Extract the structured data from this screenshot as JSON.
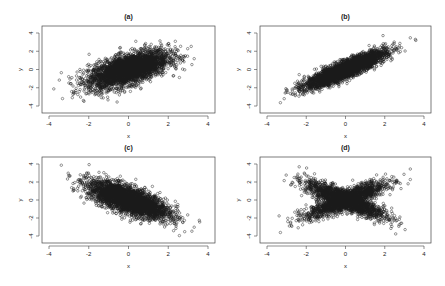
{
  "chart_data": [
    {
      "type": "scatter",
      "title": "(a)",
      "xlabel": "x",
      "ylabel": "y",
      "xlim": [
        -4,
        4
      ],
      "ylim": [
        -4,
        4
      ],
      "xticks": [
        -4,
        -2,
        0,
        2,
        4
      ],
      "yticks": [
        -4,
        -2,
        0,
        2,
        4
      ],
      "grid": false,
      "n_points": 5000,
      "marker": "open-circle",
      "description": "bivariate normal, moderate positive correlation",
      "distribution": {
        "kind": "normal",
        "rho": 0.6,
        "sx": 1,
        "sy": 1
      },
      "box": {
        "left": 42,
        "top": 26,
        "right": 215,
        "bottom": 113
      }
    },
    {
      "type": "scatter",
      "title": "(b)",
      "xlabel": "x",
      "ylabel": "y",
      "xlim": [
        -4,
        4
      ],
      "ylim": [
        -4,
        4
      ],
      "xticks": [
        -4,
        -2,
        0,
        2,
        4
      ],
      "yticks": [
        -4,
        -2,
        0,
        2,
        4
      ],
      "grid": false,
      "n_points": 5000,
      "marker": "open-circle",
      "description": "strong positive correlation, tighter at upper tail",
      "distribution": {
        "kind": "normal",
        "rho": 0.88,
        "sx": 1,
        "sy": 1
      },
      "box": {
        "left": 260,
        "top": 26,
        "right": 431,
        "bottom": 113
      }
    },
    {
      "type": "scatter",
      "title": "(c)",
      "xlabel": "x",
      "ylabel": "y",
      "xlim": [
        -4,
        4
      ],
      "ylim": [
        -4,
        4
      ],
      "xticks": [
        -4,
        -2,
        0,
        2,
        4
      ],
      "yticks": [
        -4,
        -2,
        0,
        2,
        4
      ],
      "grid": false,
      "n_points": 5000,
      "marker": "open-circle",
      "description": "bivariate normal, negative correlation",
      "distribution": {
        "kind": "normal",
        "rho": -0.7,
        "sx": 1,
        "sy": 1
      },
      "box": {
        "left": 42,
        "top": 157,
        "right": 215,
        "bottom": 243
      }
    },
    {
      "type": "scatter",
      "title": "(d)",
      "xlabel": "x",
      "ylabel": "y",
      "xlim": [
        -4,
        4
      ],
      "ylim": [
        -4,
        4
      ],
      "xticks": [
        -4,
        -2,
        0,
        2,
        4
      ],
      "yticks": [
        -4,
        -2,
        0,
        2,
        4
      ],
      "grid": false,
      "n_points": 5000,
      "marker": "open-circle",
      "description": "X-shaped mixture of positive and negative correlation",
      "distribution": {
        "kind": "x-mixture",
        "rho": 0.85,
        "sx": 1,
        "sy": 1
      },
      "box": {
        "left": 260,
        "top": 157,
        "right": 431,
        "bottom": 243
      }
    }
  ],
  "style": {
    "point_color": "#1a1a1a",
    "axis_color": "#444444",
    "background": "#ffffff"
  }
}
